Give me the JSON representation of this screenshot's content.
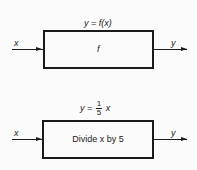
{
  "diagrams": [
    {
      "equation": "y = f(x)",
      "box_label": "f",
      "input_label": "x",
      "output_label": "y"
    },
    {
      "equation_prefix": "y =",
      "equation_fraction": {
        "numerator": "1",
        "denominator": "5"
      },
      "equation_suffix": "x",
      "box_label": "Divide x by 5",
      "input_label": "x",
      "output_label": "y"
    }
  ]
}
